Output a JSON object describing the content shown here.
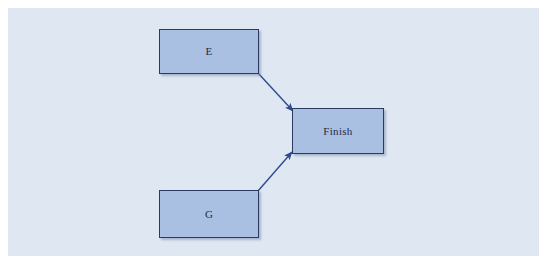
{
  "diagram": {
    "type": "node-link-flow",
    "canvas": {
      "background_color": "#ffffff",
      "panel_color": "#dfe7f3",
      "width": 550,
      "height": 271
    },
    "style": {
      "node_fill": "#a9c0e2",
      "node_border": "#2b3a63",
      "label_color": "#1f2b4d",
      "edge_color": "#2e4b8f"
    },
    "nodes": [
      {
        "id": "E",
        "label": "E",
        "x": 159,
        "y": 29,
        "width": 100,
        "height": 45
      },
      {
        "id": "Finish",
        "label": "Finish",
        "x": 292,
        "y": 108,
        "width": 92,
        "height": 46
      },
      {
        "id": "G",
        "label": "G",
        "x": 159,
        "y": 190,
        "width": 100,
        "height": 48
      }
    ],
    "edges": [
      {
        "id": "edge-e-finish",
        "from": "E",
        "to": "Finish",
        "label": "",
        "arrowhead": "filled-triangle",
        "x1": 258,
        "y1": 73,
        "x2": 293,
        "y2": 111
      },
      {
        "id": "edge-g-finish",
        "from": "G",
        "to": "Finish",
        "label": "",
        "arrowhead": "filled-triangle",
        "x1": 258,
        "y1": 191,
        "x2": 292,
        "y2": 152
      }
    ]
  }
}
